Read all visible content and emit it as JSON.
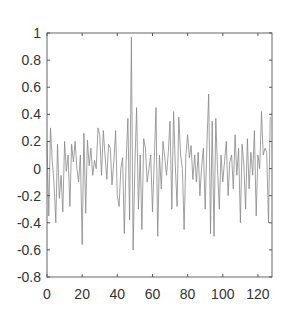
{
  "chart_data": {
    "type": "line",
    "title": "",
    "xlabel": "",
    "ylabel": "",
    "xlim": [
      0,
      128
    ],
    "ylim": [
      -0.8,
      1.0
    ],
    "grid": false,
    "legend": null,
    "line_color": "#888888",
    "axis_color": "#555555",
    "x_ticks": [
      0,
      20,
      40,
      60,
      80,
      100,
      120
    ],
    "x_tick_labels": [
      "0",
      "20",
      "40",
      "60",
      "80",
      "100",
      "120"
    ],
    "y_ticks": [
      1,
      0.8,
      0.6,
      0.4,
      0.2,
      0,
      -0.2,
      -0.4,
      -0.6,
      -0.8
    ],
    "y_tick_labels": [
      "1",
      "0.8",
      "0.6",
      "0.4",
      "0.2",
      "0",
      "-0.2",
      "-0.4",
      "-0.6",
      "-0.8"
    ],
    "series": [
      {
        "name": "signal",
        "x_start": 0,
        "x_step": 1,
        "values": [
          0.2,
          -0.35,
          0.3,
          0.05,
          -0.1,
          -0.4,
          0.18,
          -0.22,
          -0.05,
          -0.32,
          0.2,
          -0.02,
          0.1,
          -0.28,
          0.18,
          0.05,
          0.2,
          0.0,
          -0.1,
          0.1,
          -0.56,
          0.26,
          -0.33,
          0.21,
          0.02,
          0.15,
          -0.05,
          0.06,
          0.0,
          0.3,
          0.25,
          -0.05,
          0.28,
          0.1,
          -0.08,
          0.18,
          0.15,
          -0.12,
          0.05,
          0.28,
          -0.2,
          -0.28,
          0.0,
          0.08,
          -0.48,
          0.05,
          0.37,
          -0.38,
          0.97,
          -0.6,
          0.02,
          0.45,
          -0.3,
          0.1,
          -0.45,
          0.22,
          0.15,
          -0.1,
          0.0,
          0.1,
          -0.32,
          0.05,
          0.45,
          -0.5,
          0.1,
          -0.15,
          0.2,
          0.08,
          -0.05,
          0.12,
          0.35,
          -0.3,
          0.42,
          0.02,
          -0.28,
          0.38,
          0.1,
          0.0,
          -0.45,
          0.1,
          0.25,
          0.08,
          0.17,
          -0.08,
          0.1,
          -0.1,
          0.12,
          -0.2,
          0.02,
          0.15,
          -0.3,
          0.2,
          0.55,
          -0.48,
          0.35,
          -0.5,
          0.37,
          0.0,
          -0.3,
          0.1,
          -0.1,
          0.05,
          0.2,
          -0.2,
          0.05,
          0.1,
          -0.15,
          0.25,
          -0.05,
          0.15,
          -0.4,
          0.18,
          0.02,
          -0.3,
          0.22,
          -0.15,
          0.12,
          -0.05,
          0.28,
          -0.35,
          0.1,
          0.0,
          0.42,
          0.1,
          0.15,
          0.12,
          -0.4,
          0.38
        ]
      }
    ]
  }
}
